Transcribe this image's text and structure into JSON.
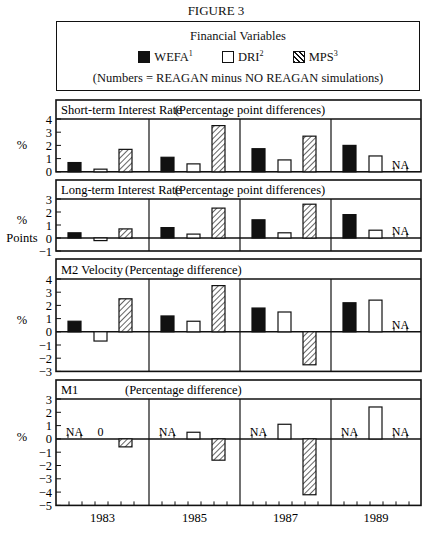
{
  "figure": {
    "title": "FIGURE 3",
    "legend": {
      "heading": "Financial Variables",
      "items": [
        {
          "label": "WEFA",
          "sup": "1",
          "style": "black"
        },
        {
          "label": "DRI",
          "sup": "2",
          "style": "white"
        },
        {
          "label": "MPS",
          "sup": "3",
          "style": "hatch"
        }
      ],
      "note": "(Numbers = REAGAN minus NO REAGAN simulations)"
    }
  },
  "chart_data": [
    {
      "type": "bar",
      "title": "Short-term Interest Rate",
      "subtitle": "(Percentage point differences)",
      "ylabel": "%",
      "ylim": [
        0,
        4
      ],
      "yticks": [
        0,
        1,
        2,
        3,
        4
      ],
      "categories": [
        "1983",
        "1985",
        "1987",
        "1989"
      ],
      "series": [
        {
          "name": "WEFA",
          "values": [
            0.7,
            1.1,
            1.75,
            2.0
          ]
        },
        {
          "name": "DRI",
          "values": [
            0.2,
            0.6,
            0.9,
            1.2
          ]
        },
        {
          "name": "MPS",
          "values": [
            1.7,
            3.5,
            2.7,
            null
          ]
        }
      ],
      "annotations": [
        {
          "category": "1989",
          "series": "MPS",
          "text": "NA"
        }
      ]
    },
    {
      "type": "bar",
      "title": "Long-term Interest Rate",
      "subtitle": "(Percentage point differences)",
      "ylabel": "% Points",
      "ylim": [
        -1,
        3
      ],
      "yticks": [
        -1,
        0,
        1,
        2,
        3
      ],
      "categories": [
        "1983",
        "1985",
        "1987",
        "1989"
      ],
      "series": [
        {
          "name": "WEFA",
          "values": [
            0.4,
            0.8,
            1.4,
            1.8
          ]
        },
        {
          "name": "DRI",
          "values": [
            -0.2,
            0.3,
            0.4,
            0.6
          ]
        },
        {
          "name": "MPS",
          "values": [
            0.7,
            2.3,
            2.6,
            null
          ]
        }
      ],
      "annotations": [
        {
          "category": "1989",
          "series": "MPS",
          "text": "NA"
        }
      ]
    },
    {
      "type": "bar",
      "title": "M2 Velocity",
      "subtitle": "(Percentage difference)",
      "ylabel": "%",
      "ylim": [
        -3,
        4
      ],
      "yticks": [
        -3,
        -2,
        -1,
        0,
        1,
        2,
        3,
        4
      ],
      "categories": [
        "1983",
        "1985",
        "1987",
        "1989"
      ],
      "series": [
        {
          "name": "WEFA",
          "values": [
            0.8,
            1.2,
            1.8,
            2.2
          ]
        },
        {
          "name": "DRI",
          "values": [
            -0.7,
            0.8,
            1.5,
            2.4
          ]
        },
        {
          "name": "MPS",
          "values": [
            2.5,
            3.5,
            -2.5,
            null
          ]
        }
      ],
      "annotations": [
        {
          "category": "1989",
          "series": "MPS",
          "text": "NA"
        }
      ]
    },
    {
      "type": "bar",
      "title": "M1",
      "subtitle": "(Percentage difference)",
      "ylabel": "%",
      "ylim": [
        -5,
        3
      ],
      "yticks": [
        -5,
        -4,
        -3,
        -2,
        -1,
        0,
        1,
        2,
        3
      ],
      "categories": [
        "1983",
        "1985",
        "1987",
        "1989"
      ],
      "xlabel_ticks": [
        "1983",
        "1985",
        "1987",
        "1989"
      ],
      "series": [
        {
          "name": "WEFA",
          "values": [
            null,
            null,
            null,
            null
          ]
        },
        {
          "name": "DRI",
          "values": [
            0,
            0.5,
            1.1,
            2.4
          ]
        },
        {
          "name": "MPS",
          "values": [
            -0.6,
            -1.6,
            -4.2,
            null
          ]
        }
      ],
      "annotations": [
        {
          "category": "1983",
          "series": "WEFA",
          "text": "NA"
        },
        {
          "category": "1983",
          "series": "DRI",
          "text": "0"
        },
        {
          "category": "1985",
          "series": "WEFA",
          "text": "NA"
        },
        {
          "category": "1987",
          "series": "WEFA",
          "text": "NA"
        },
        {
          "category": "1989",
          "series": "WEFA",
          "text": "NA"
        },
        {
          "category": "1989",
          "series": "MPS",
          "text": "NA"
        }
      ]
    }
  ]
}
